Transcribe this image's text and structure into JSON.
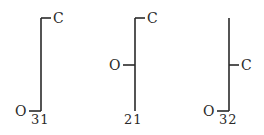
{
  "diagrams": [
    {
      "id": "diagram-31",
      "top_label": "C",
      "side_label": "O",
      "number": "31",
      "c_position": "top",
      "o_position": "bottom"
    },
    {
      "id": "diagram-21",
      "top_label": "C",
      "side_label": "O",
      "number": "21",
      "c_position": "top",
      "o_position": "middle"
    },
    {
      "id": "diagram-32",
      "top_label": "C",
      "side_label": "O",
      "number": "32",
      "c_position": "middle",
      "o_position": "bottom"
    }
  ],
  "colors": {
    "line": "#2a2a2a",
    "background": "#ffffff"
  }
}
